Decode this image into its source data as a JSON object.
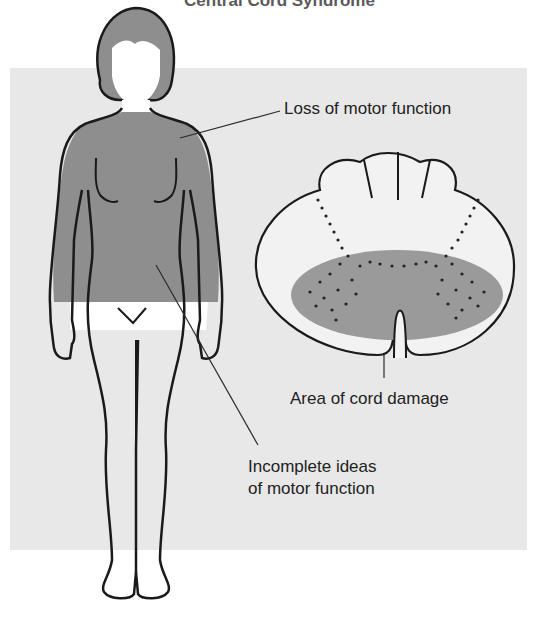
{
  "title": "Central Cord Syndrome",
  "labels": {
    "loss_motor": "Loss of motor function",
    "cord_damage": "Area of cord damage",
    "incomplete_line1": "Incomplete ideas",
    "incomplete_line2": "of motor function"
  },
  "colors": {
    "panel_background": "#e8e8e8",
    "affected_region": "#8e8e8e",
    "damage_zone": "#9a9a9a",
    "outline": "#1a1a1a"
  }
}
